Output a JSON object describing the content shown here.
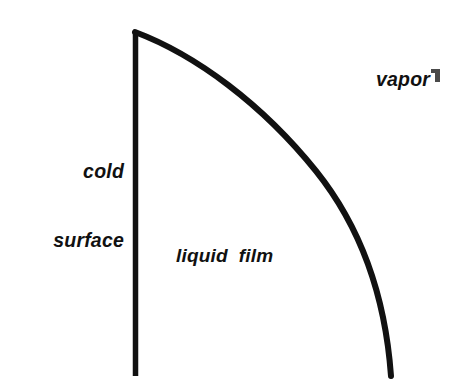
{
  "figure": {
    "name": "film-condensation-diagram",
    "width": 462,
    "height": 390,
    "background_color": "#ffffff",
    "ink_color": "#111111"
  },
  "labels": {
    "cold_surface_line_1": "cold",
    "cold_surface_line_2": "surface",
    "vapor": "vapor",
    "liquid_film": "liquid  film"
  },
  "geometry": {
    "wall": {
      "name": "cold-surface-wall",
      "x": 135.5,
      "y_top": 31,
      "y_bottom": 376,
      "stroke_width": 5.5
    },
    "interface_curve": {
      "name": "liquid-vapor-interface",
      "stroke_width": 6,
      "path": "M 135 32 C 196 55, 262 104, 316 171 C 360 226, 385 293, 391 376",
      "sample_points": [
        [
          135,
          32
        ],
        [
          200,
          62
        ],
        [
          268,
          110
        ],
        [
          310,
          162
        ],
        [
          337,
          200
        ],
        [
          362,
          248
        ],
        [
          375,
          280
        ],
        [
          386,
          326
        ],
        [
          391,
          376
        ]
      ]
    },
    "edge_artifact": {
      "name": "scan-artifact",
      "x": 431,
      "y": 69,
      "width": 9,
      "height": 13
    }
  }
}
